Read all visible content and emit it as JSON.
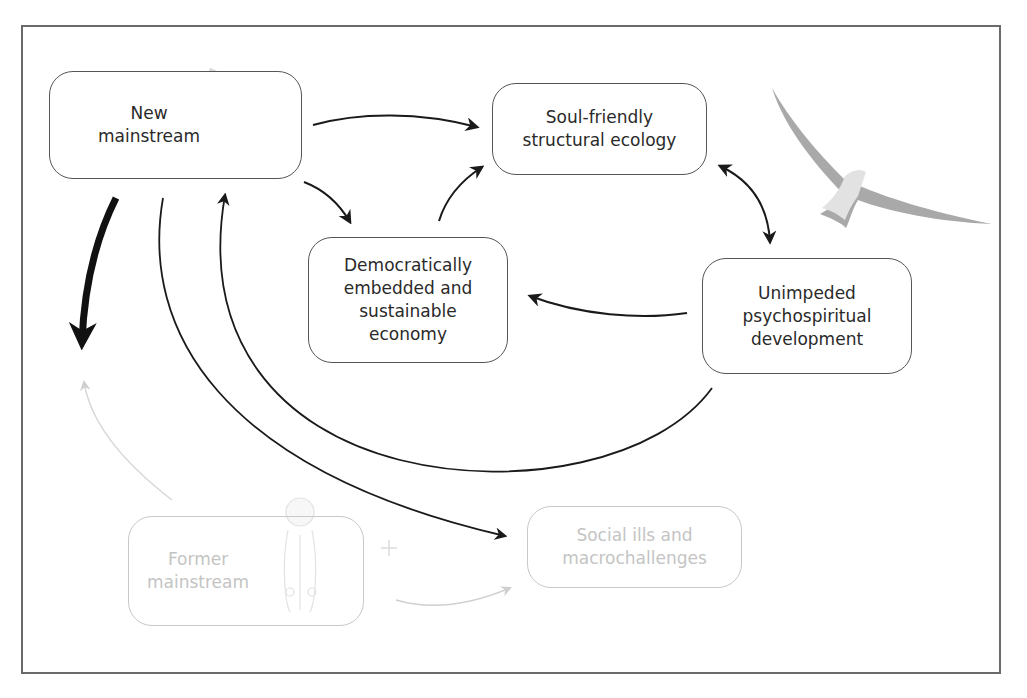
{
  "nodes": {
    "new_mainstream": "New\nmainstream",
    "soul_friendly": "Soul-friendly\nstructural ecology",
    "democratic_economy": "Democratically\nembedded and\nsustainable\neconomy",
    "psychospiritual": "Unimpeded\npsychospiritual\ndevelopment",
    "former_mainstream": "Former\nmainstream",
    "social_ills": "Social ills and\nmacrochallenges"
  },
  "images": {
    "new_mainstream": "joined-hands-circle-icon",
    "soul_friendly": "seagull-flying-icon",
    "former_mainstream": "doctor-figure-icon"
  },
  "edges": [
    {
      "from": "new_mainstream",
      "to": "soul_friendly",
      "style": "solid"
    },
    {
      "from": "new_mainstream",
      "to": "democratic_economy",
      "style": "solid"
    },
    {
      "from": "democratic_economy",
      "to": "soul_friendly",
      "style": "solid"
    },
    {
      "from": "soul_friendly",
      "to": "psychospiritual",
      "style": "bidirectional"
    },
    {
      "from": "psychospiritual",
      "to": "democratic_economy",
      "style": "solid"
    },
    {
      "from": "psychospiritual",
      "to": "new_mainstream",
      "style": "solid-loop"
    },
    {
      "from": "new_mainstream",
      "to": "social_ills",
      "style": "solid-loop"
    },
    {
      "from": "new_mainstream",
      "to": "former_mainstream",
      "style": "thick"
    },
    {
      "from": "former_mainstream",
      "to": "new_mainstream",
      "style": "faded"
    },
    {
      "from": "former_mainstream",
      "to": "social_ills",
      "style": "faded"
    }
  ],
  "colors": {
    "stroke": "#1a1a1a",
    "box_border": "#555555",
    "faded": "#c8c8c8",
    "frame": "#6a6a6a"
  }
}
